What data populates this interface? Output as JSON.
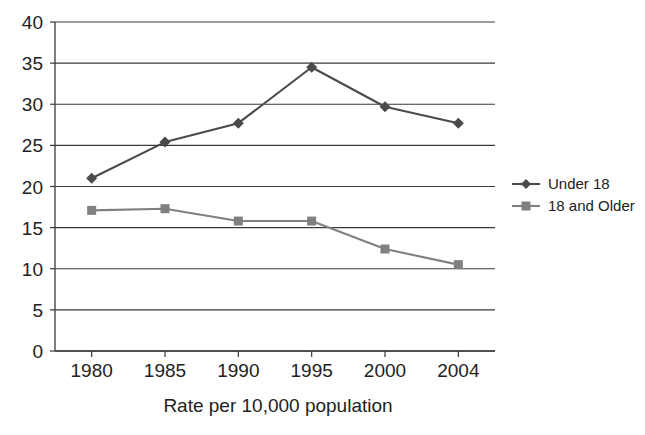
{
  "chart_data": {
    "type": "line",
    "title": "",
    "subtitle": "",
    "xlabel": "Rate per 10,000 population",
    "ylabel": "",
    "categories": [
      "1980",
      "1985",
      "1990",
      "1995",
      "2000",
      "2004"
    ],
    "x": [
      1980,
      1985,
      1990,
      1995,
      2000,
      2004
    ],
    "series": [
      {
        "name": "Under 18",
        "marker": "diamond",
        "color": "#4a4a4a",
        "values": [
          21.0,
          25.4,
          27.7,
          34.5,
          29.7,
          27.7
        ]
      },
      {
        "name": "18 and Older",
        "marker": "square",
        "color": "#808080",
        "values": [
          17.1,
          17.3,
          15.8,
          15.8,
          12.4,
          10.5
        ]
      }
    ],
    "ylim": [
      0,
      40
    ],
    "yticks": [
      0,
      5,
      10,
      15,
      20,
      25,
      30,
      35,
      40
    ],
    "ytick_labels": [
      "0",
      "5",
      "10",
      "15",
      "20",
      "25",
      "30",
      "35",
      "40"
    ],
    "xtick_labels": [
      "1980",
      "1985",
      "1990",
      "1995",
      "2000",
      "2004"
    ],
    "grid": "horizontal",
    "legend_position": "right",
    "legend_entries": [
      "Under 18",
      "18 and Older"
    ]
  },
  "colors": {
    "series_under18": "#4a4a4a",
    "series_18older": "#808080",
    "axis": "#3a3a3a",
    "text": "#222222",
    "background": "#ffffff"
  }
}
